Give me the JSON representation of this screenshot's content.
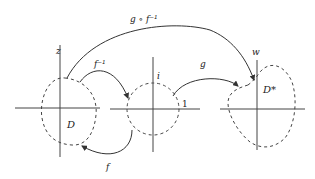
{
  "diagram": {
    "planes": [
      {
        "id": "z",
        "label": "z",
        "region_label": "D"
      },
      {
        "id": "i",
        "label": "i",
        "tick_label": "1"
      },
      {
        "id": "w",
        "label": "w",
        "region_label": "D*"
      }
    ],
    "arrows": [
      {
        "id": "g-compose-f-inverse",
        "label": "g ∘ f⁻¹",
        "from": "z",
        "to": "w"
      },
      {
        "id": "f-inverse",
        "label": "f⁻¹",
        "from": "z",
        "to": "i"
      },
      {
        "id": "g",
        "label": "g",
        "from": "i",
        "to": "w"
      },
      {
        "id": "f",
        "label": "f",
        "from": "i",
        "to": "z"
      }
    ],
    "colors": {
      "stroke": "#333333",
      "background": "#ffffff"
    }
  }
}
